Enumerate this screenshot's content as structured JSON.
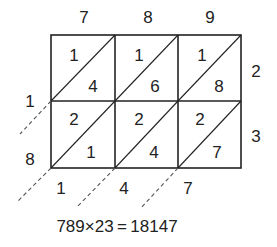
{
  "multiplicand_digits": [
    "7",
    "8",
    "9"
  ],
  "multiplier_digits": [
    "2",
    "3"
  ],
  "cells": [
    [
      {
        "tens": "1",
        "ones": "4"
      },
      {
        "tens": "1",
        "ones": "6"
      },
      {
        "tens": "1",
        "ones": "8"
      }
    ],
    [
      {
        "tens": "2",
        "ones": "1"
      },
      {
        "tens": "2",
        "ones": "4"
      },
      {
        "tens": "2",
        "ones": "7"
      }
    ]
  ],
  "left_result_digits": [
    "1",
    "8"
  ],
  "bottom_result_digits": [
    "1",
    "4",
    "7"
  ],
  "equation": "789×23 = 18147",
  "colors": {
    "line": "#222222",
    "background": "#ffffff"
  }
}
